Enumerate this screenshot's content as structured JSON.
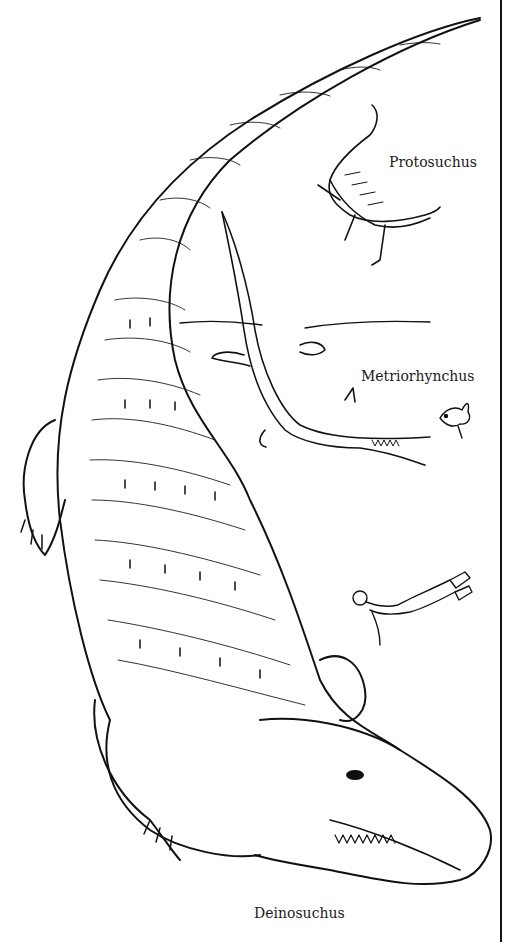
{
  "illustration": {
    "subjects": [
      {
        "id": "deinosuchus",
        "label": "Deinosuchus",
        "depiction": "giant crocodile viewed from above, curving tail, open jaws"
      },
      {
        "id": "protosuchus",
        "label": "Protosuchus",
        "depiction": "small early crocodilian"
      },
      {
        "id": "metriorhynchus",
        "label": "Metriorhynchus",
        "depiction": "marine crocodile swimming at the water surface"
      },
      {
        "id": "fish",
        "label": "",
        "depiction": "small fish"
      },
      {
        "id": "diver",
        "label": "",
        "depiction": "human scuba diver for scale"
      }
    ],
    "colors": {
      "ink": "#111111",
      "paper": "#ffffff"
    }
  }
}
